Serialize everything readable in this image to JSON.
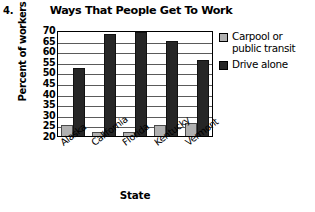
{
  "problem_number": "4.",
  "chart_data": {
    "type": "bar",
    "title": "Ways That People Get To Work",
    "xlabel": "State",
    "ylabel": "Percent of workers",
    "categories": [
      "Alaska",
      "California",
      "Florida",
      "Kentucky",
      "Vermont"
    ],
    "series": [
      {
        "name": "Carpool or public transit",
        "color": "#b0b0b0",
        "values": [
          25,
          22,
          22,
          25,
          26
        ]
      },
      {
        "name": "Drive alone",
        "color": "#262626",
        "values": [
          52,
          68,
          69,
          65,
          56
        ]
      }
    ],
    "ylim": [
      20,
      70
    ],
    "ytick_step": 5,
    "yticks": [
      70,
      65,
      60,
      55,
      50,
      45,
      40,
      35,
      30,
      25,
      20
    ],
    "grid": true,
    "legend_position": "right"
  },
  "legend": {
    "items": [
      {
        "label": "Carpool or public transit",
        "swatch": "carpool"
      },
      {
        "label": "Drive alone",
        "swatch": "drive"
      }
    ]
  }
}
